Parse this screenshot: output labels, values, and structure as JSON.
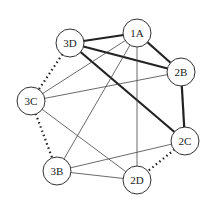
{
  "diagram": {
    "type": "graph",
    "nodes": [
      {
        "id": "1A",
        "label": "1A",
        "x": 137,
        "y": 33
      },
      {
        "id": "2B",
        "label": "2B",
        "x": 181,
        "y": 72
      },
      {
        "id": "2C",
        "label": "2C",
        "x": 185,
        "y": 141
      },
      {
        "id": "2D",
        "label": "2D",
        "x": 137,
        "y": 180
      },
      {
        "id": "3B",
        "label": "3B",
        "x": 57,
        "y": 171
      },
      {
        "id": "3C",
        "label": "3C",
        "x": 31,
        "y": 101
      },
      {
        "id": "3D",
        "label": "3D",
        "x": 70,
        "y": 43
      }
    ],
    "edges": [
      {
        "from": "3D",
        "to": "1A",
        "style": "thick"
      },
      {
        "from": "1A",
        "to": "2B",
        "style": "thick"
      },
      {
        "from": "3D",
        "to": "2B",
        "style": "thick"
      },
      {
        "from": "3D",
        "to": "2C",
        "style": "thick"
      },
      {
        "from": "2B",
        "to": "2C",
        "style": "thick"
      },
      {
        "from": "3D",
        "to": "3C",
        "style": "dotted"
      },
      {
        "from": "3C",
        "to": "3B",
        "style": "dotted"
      },
      {
        "from": "2C",
        "to": "2D",
        "style": "dotted"
      },
      {
        "from": "1A",
        "to": "3C",
        "style": "thin"
      },
      {
        "from": "1A",
        "to": "3B",
        "style": "thin"
      },
      {
        "from": "1A",
        "to": "2D",
        "style": "thin"
      },
      {
        "from": "3C",
        "to": "2B",
        "style": "thin"
      },
      {
        "from": "3C",
        "to": "2D",
        "style": "thin"
      },
      {
        "from": "3B",
        "to": "2C",
        "style": "thin"
      },
      {
        "from": "3B",
        "to": "2D",
        "style": "thin"
      }
    ],
    "node_radius": 14
  }
}
